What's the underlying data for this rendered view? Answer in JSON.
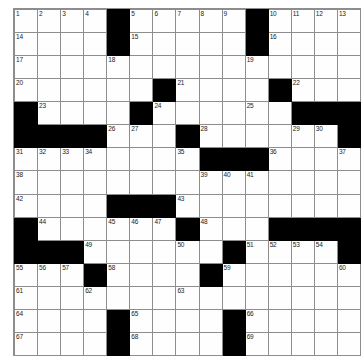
{
  "puzzle": {
    "title": "Crossword Grid",
    "rows": 15,
    "cols": 14,
    "colors": {
      "block": "#000000",
      "cell": "#fefefe",
      "grid_line": "#8d8d8d",
      "number_text": "#1a1a1a",
      "page_background": "#ffffff"
    },
    "max_clue_number": 69,
    "grid": [
      [
        {
          "type": "cell",
          "number": "1"
        },
        {
          "type": "cell",
          "number": "2"
        },
        {
          "type": "cell",
          "number": "3"
        },
        {
          "type": "cell",
          "number": "4"
        },
        {
          "type": "block",
          "number": ""
        },
        {
          "type": "cell",
          "number": "5"
        },
        {
          "type": "cell",
          "number": "6"
        },
        {
          "type": "cell",
          "number": "7"
        },
        {
          "type": "cell",
          "number": "8"
        },
        {
          "type": "cell",
          "number": "9"
        },
        {
          "type": "block",
          "number": ""
        },
        {
          "type": "cell",
          "number": "10"
        },
        {
          "type": "cell",
          "number": "11"
        },
        {
          "type": "cell",
          "number": "12"
        },
        {
          "type": "cell",
          "number": "13"
        }
      ],
      [
        {
          "type": "cell",
          "number": "14"
        },
        {
          "type": "cell",
          "number": ""
        },
        {
          "type": "cell",
          "number": ""
        },
        {
          "type": "cell",
          "number": ""
        },
        {
          "type": "block",
          "number": ""
        },
        {
          "type": "cell",
          "number": "15"
        },
        {
          "type": "cell",
          "number": ""
        },
        {
          "type": "cell",
          "number": ""
        },
        {
          "type": "cell",
          "number": ""
        },
        {
          "type": "cell",
          "number": ""
        },
        {
          "type": "block",
          "number": ""
        },
        {
          "type": "cell",
          "number": "16"
        },
        {
          "type": "cell",
          "number": ""
        },
        {
          "type": "cell",
          "number": ""
        },
        {
          "type": "cell",
          "number": ""
        }
      ],
      [
        {
          "type": "cell",
          "number": "17"
        },
        {
          "type": "cell",
          "number": ""
        },
        {
          "type": "cell",
          "number": ""
        },
        {
          "type": "cell",
          "number": ""
        },
        {
          "type": "cell",
          "number": "18"
        },
        {
          "type": "cell",
          "number": ""
        },
        {
          "type": "cell",
          "number": ""
        },
        {
          "type": "cell",
          "number": ""
        },
        {
          "type": "cell",
          "number": ""
        },
        {
          "type": "cell",
          "number": ""
        },
        {
          "type": "cell",
          "number": "19"
        },
        {
          "type": "cell",
          "number": ""
        },
        {
          "type": "cell",
          "number": ""
        },
        {
          "type": "cell",
          "number": ""
        },
        {
          "type": "cell",
          "number": ""
        }
      ],
      [
        {
          "type": "cell",
          "number": "20"
        },
        {
          "type": "cell",
          "number": ""
        },
        {
          "type": "cell",
          "number": ""
        },
        {
          "type": "cell",
          "number": ""
        },
        {
          "type": "cell",
          "number": ""
        },
        {
          "type": "cell",
          "number": ""
        },
        {
          "type": "block",
          "number": ""
        },
        {
          "type": "cell",
          "number": "21"
        },
        {
          "type": "cell",
          "number": ""
        },
        {
          "type": "cell",
          "number": ""
        },
        {
          "type": "cell",
          "number": ""
        },
        {
          "type": "block",
          "number": ""
        },
        {
          "type": "cell",
          "number": "22"
        },
        {
          "type": "cell",
          "number": ""
        },
        {
          "type": "cell",
          "number": ""
        }
      ],
      [
        {
          "type": "block",
          "number": ""
        },
        {
          "type": "cell",
          "number": "23"
        },
        {
          "type": "cell",
          "number": ""
        },
        {
          "type": "cell",
          "number": ""
        },
        {
          "type": "cell",
          "number": ""
        },
        {
          "type": "block",
          "number": ""
        },
        {
          "type": "cell",
          "number": "24"
        },
        {
          "type": "cell",
          "number": ""
        },
        {
          "type": "cell",
          "number": ""
        },
        {
          "type": "cell",
          "number": ""
        },
        {
          "type": "cell",
          "number": "25"
        },
        {
          "type": "cell",
          "number": ""
        },
        {
          "type": "block",
          "number": ""
        },
        {
          "type": "block",
          "number": ""
        },
        {
          "type": "block",
          "number": ""
        }
      ],
      [
        {
          "type": "block",
          "number": ""
        },
        {
          "type": "block",
          "number": ""
        },
        {
          "type": "block",
          "number": ""
        },
        {
          "type": "block",
          "number": ""
        },
        {
          "type": "cell",
          "number": "26"
        },
        {
          "type": "cell",
          "number": "27"
        },
        {
          "type": "cell",
          "number": ""
        },
        {
          "type": "block",
          "number": ""
        },
        {
          "type": "cell",
          "number": "28"
        },
        {
          "type": "cell",
          "number": ""
        },
        {
          "type": "cell",
          "number": ""
        },
        {
          "type": "cell",
          "number": ""
        },
        {
          "type": "cell",
          "number": "29"
        },
        {
          "type": "cell",
          "number": "30"
        },
        {
          "type": "block",
          "number": ""
        }
      ],
      [
        {
          "type": "cell",
          "number": "31"
        },
        {
          "type": "cell",
          "number": "32"
        },
        {
          "type": "cell",
          "number": "33"
        },
        {
          "type": "cell",
          "number": "34"
        },
        {
          "type": "cell",
          "number": ""
        },
        {
          "type": "cell",
          "number": ""
        },
        {
          "type": "cell",
          "number": ""
        },
        {
          "type": "cell",
          "number": "35"
        },
        {
          "type": "block",
          "number": ""
        },
        {
          "type": "block",
          "number": ""
        },
        {
          "type": "block",
          "number": ""
        },
        {
          "type": "cell",
          "number": "36"
        },
        {
          "type": "cell",
          "number": ""
        },
        {
          "type": "cell",
          "number": ""
        },
        {
          "type": "cell",
          "number": "37"
        }
      ],
      [
        {
          "type": "cell",
          "number": "38"
        },
        {
          "type": "cell",
          "number": ""
        },
        {
          "type": "cell",
          "number": ""
        },
        {
          "type": "cell",
          "number": ""
        },
        {
          "type": "cell",
          "number": ""
        },
        {
          "type": "cell",
          "number": ""
        },
        {
          "type": "cell",
          "number": ""
        },
        {
          "type": "cell",
          "number": ""
        },
        {
          "type": "cell",
          "number": "39"
        },
        {
          "type": "cell",
          "number": "40"
        },
        {
          "type": "cell",
          "number": "41"
        },
        {
          "type": "cell",
          "number": ""
        },
        {
          "type": "cell",
          "number": ""
        },
        {
          "type": "cell",
          "number": ""
        },
        {
          "type": "cell",
          "number": ""
        }
      ],
      [
        {
          "type": "cell",
          "number": "42"
        },
        {
          "type": "cell",
          "number": ""
        },
        {
          "type": "cell",
          "number": ""
        },
        {
          "type": "cell",
          "number": ""
        },
        {
          "type": "block",
          "number": ""
        },
        {
          "type": "block",
          "number": ""
        },
        {
          "type": "block",
          "number": ""
        },
        {
          "type": "cell",
          "number": "43"
        },
        {
          "type": "cell",
          "number": ""
        },
        {
          "type": "cell",
          "number": ""
        },
        {
          "type": "cell",
          "number": ""
        },
        {
          "type": "cell",
          "number": ""
        },
        {
          "type": "cell",
          "number": ""
        },
        {
          "type": "cell",
          "number": ""
        },
        {
          "type": "cell",
          "number": ""
        }
      ],
      [
        {
          "type": "block",
          "number": ""
        },
        {
          "type": "cell",
          "number": "44"
        },
        {
          "type": "cell",
          "number": ""
        },
        {
          "type": "cell",
          "number": ""
        },
        {
          "type": "cell",
          "number": "45"
        },
        {
          "type": "cell",
          "number": "46"
        },
        {
          "type": "cell",
          "number": "47"
        },
        {
          "type": "block",
          "number": ""
        },
        {
          "type": "cell",
          "number": "48"
        },
        {
          "type": "cell",
          "number": ""
        },
        {
          "type": "cell",
          "number": ""
        },
        {
          "type": "block",
          "number": ""
        },
        {
          "type": "block",
          "number": ""
        },
        {
          "type": "block",
          "number": ""
        },
        {
          "type": "block",
          "number": ""
        }
      ],
      [
        {
          "type": "block",
          "number": ""
        },
        {
          "type": "block",
          "number": ""
        },
        {
          "type": "block",
          "number": ""
        },
        {
          "type": "cell",
          "number": "49"
        },
        {
          "type": "cell",
          "number": ""
        },
        {
          "type": "cell",
          "number": ""
        },
        {
          "type": "cell",
          "number": ""
        },
        {
          "type": "cell",
          "number": "50"
        },
        {
          "type": "cell",
          "number": ""
        },
        {
          "type": "block",
          "number": ""
        },
        {
          "type": "cell",
          "number": "51"
        },
        {
          "type": "cell",
          "number": "52"
        },
        {
          "type": "cell",
          "number": "53"
        },
        {
          "type": "cell",
          "number": "54"
        },
        {
          "type": "block",
          "number": ""
        }
      ],
      [
        {
          "type": "cell",
          "number": "55"
        },
        {
          "type": "cell",
          "number": "56"
        },
        {
          "type": "cell",
          "number": "57"
        },
        {
          "type": "block",
          "number": ""
        },
        {
          "type": "cell",
          "number": "58"
        },
        {
          "type": "cell",
          "number": ""
        },
        {
          "type": "cell",
          "number": ""
        },
        {
          "type": "cell",
          "number": ""
        },
        {
          "type": "block",
          "number": ""
        },
        {
          "type": "cell",
          "number": "59"
        },
        {
          "type": "cell",
          "number": ""
        },
        {
          "type": "cell",
          "number": ""
        },
        {
          "type": "cell",
          "number": ""
        },
        {
          "type": "cell",
          "number": ""
        },
        {
          "type": "cell",
          "number": "60"
        }
      ],
      [
        {
          "type": "cell",
          "number": "61"
        },
        {
          "type": "cell",
          "number": ""
        },
        {
          "type": "cell",
          "number": ""
        },
        {
          "type": "cell",
          "number": "62"
        },
        {
          "type": "cell",
          "number": ""
        },
        {
          "type": "cell",
          "number": ""
        },
        {
          "type": "cell",
          "number": ""
        },
        {
          "type": "cell",
          "number": "63"
        },
        {
          "type": "cell",
          "number": ""
        },
        {
          "type": "cell",
          "number": ""
        },
        {
          "type": "cell",
          "number": ""
        },
        {
          "type": "cell",
          "number": ""
        },
        {
          "type": "cell",
          "number": ""
        },
        {
          "type": "cell",
          "number": ""
        },
        {
          "type": "cell",
          "number": ""
        }
      ],
      [
        {
          "type": "cell",
          "number": "64"
        },
        {
          "type": "cell",
          "number": ""
        },
        {
          "type": "cell",
          "number": ""
        },
        {
          "type": "cell",
          "number": ""
        },
        {
          "type": "block",
          "number": ""
        },
        {
          "type": "cell",
          "number": "65"
        },
        {
          "type": "cell",
          "number": ""
        },
        {
          "type": "cell",
          "number": ""
        },
        {
          "type": "cell",
          "number": ""
        },
        {
          "type": "block",
          "number": ""
        },
        {
          "type": "cell",
          "number": "66"
        },
        {
          "type": "cell",
          "number": ""
        },
        {
          "type": "cell",
          "number": ""
        },
        {
          "type": "cell",
          "number": ""
        },
        {
          "type": "cell",
          "number": ""
        }
      ],
      [
        {
          "type": "cell",
          "number": "67"
        },
        {
          "type": "cell",
          "number": ""
        },
        {
          "type": "cell",
          "number": ""
        },
        {
          "type": "cell",
          "number": ""
        },
        {
          "type": "block",
          "number": ""
        },
        {
          "type": "cell",
          "number": "68"
        },
        {
          "type": "cell",
          "number": ""
        },
        {
          "type": "cell",
          "number": ""
        },
        {
          "type": "cell",
          "number": ""
        },
        {
          "type": "block",
          "number": ""
        },
        {
          "type": "cell",
          "number": "69"
        },
        {
          "type": "cell",
          "number": ""
        },
        {
          "type": "cell",
          "number": ""
        },
        {
          "type": "cell",
          "number": ""
        },
        {
          "type": "cell",
          "number": ""
        }
      ]
    ]
  }
}
